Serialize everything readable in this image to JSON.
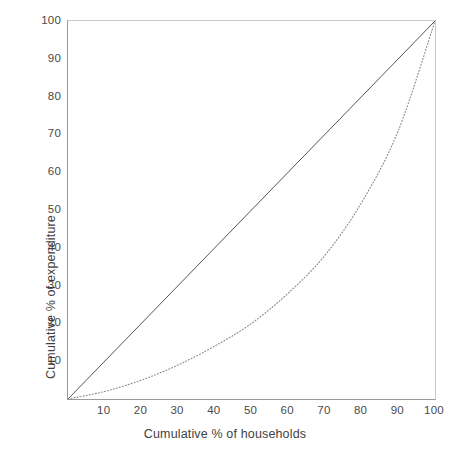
{
  "chart_data": {
    "type": "line",
    "title": "",
    "xlabel": "Cumulative % of households",
    "ylabel": "Cumulative % of expenditure",
    "xlim": [
      0,
      100
    ],
    "ylim": [
      0,
      100
    ],
    "grid": false,
    "legend": "none",
    "xticks": [
      "10",
      "20",
      "30",
      "40",
      "50",
      "60",
      "70",
      "80",
      "90",
      "100"
    ],
    "xtick_values": [
      10,
      20,
      30,
      40,
      50,
      60,
      70,
      80,
      90,
      100
    ],
    "yticks": [
      "10",
      "20",
      "30",
      "40",
      "50",
      "60",
      "70",
      "80",
      "90",
      "100"
    ],
    "ytick_values": [
      10,
      20,
      30,
      40,
      50,
      60,
      70,
      80,
      90,
      100
    ],
    "series": [
      {
        "name": "Line of equality",
        "style": "solid",
        "color": "#555555",
        "x": [
          0,
          100
        ],
        "values": [
          0,
          100
        ]
      },
      {
        "name": "Lorenz curve",
        "style": "dotted",
        "color": "#8a8a8a",
        "x": [
          0,
          10,
          20,
          30,
          40,
          50,
          60,
          70,
          80,
          90,
          100
        ],
        "values": [
          0,
          2,
          5,
          9,
          14,
          20,
          28,
          38,
          52,
          71,
          100
        ]
      }
    ]
  }
}
